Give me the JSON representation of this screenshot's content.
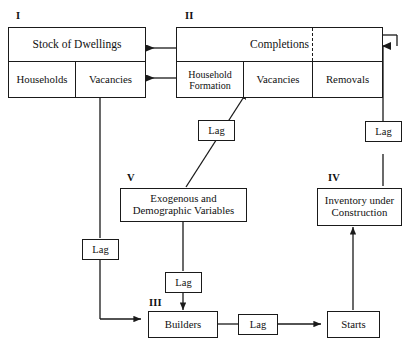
{
  "diagram": {
    "stroke_color": "#1a1a1a",
    "background": "#ffffff",
    "blocks": [
      {
        "id": "I",
        "roman": "I",
        "cells": [
          {
            "key": "stock_of_dwellings",
            "label": "Stock of Dwellings"
          },
          {
            "key": "households",
            "label": "Households"
          },
          {
            "key": "vacancies",
            "label": "Vacancies"
          }
        ]
      },
      {
        "id": "II",
        "roman": "II",
        "cells": [
          {
            "key": "completions",
            "label": "Completions"
          },
          {
            "key": "household_formation",
            "label": "Household\nFormation"
          },
          {
            "key": "vacancies",
            "label": "Vacancies"
          },
          {
            "key": "removals",
            "label": "Removals"
          }
        ]
      },
      {
        "id": "III",
        "roman": "III",
        "cells": [
          {
            "key": "builders",
            "label": "Builders"
          }
        ]
      },
      {
        "id": "IV",
        "roman": "IV",
        "cells": [
          {
            "key": "inventory_under_construction",
            "label": "Inventory under\nConstruction"
          }
        ]
      },
      {
        "id": "V",
        "roman": "V",
        "cells": [
          {
            "key": "exogenous_demographic",
            "label": "Exogenous and\nDemographic Variables"
          }
        ]
      }
    ],
    "labels": {
      "stock_of_dwellings": "Stock of Dwellings",
      "households": "Households",
      "vacancies_i": "Vacancies",
      "completions": "Completions",
      "household_formation_line1": "Household",
      "household_formation_line2": "Formation",
      "vacancies_ii": "Vacancies",
      "removals": "Removals",
      "exogenous_line1": "Exogenous and",
      "exogenous_line2": "Demographic Variables",
      "inventory_line1": "Inventory under",
      "inventory_line2": "Construction",
      "builders": "Builders",
      "starts": "Starts",
      "roman_i": "I",
      "roman_ii": "II",
      "roman_iii": "III",
      "roman_iv": "IV",
      "roman_v": "V"
    },
    "lag_boxes": [
      {
        "key": "lag_v_to_ii",
        "label": "Lag"
      },
      {
        "key": "lag_iv_to_ii",
        "label": "Lag"
      },
      {
        "key": "lag_i_to_iii",
        "label": "Lag"
      },
      {
        "key": "lag_v_to_iii",
        "label": "Lag"
      },
      {
        "key": "lag_iii_to_starts",
        "label": "Lag"
      }
    ]
  }
}
